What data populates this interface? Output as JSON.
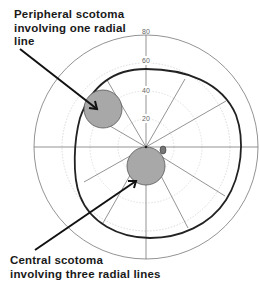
{
  "diagram": {
    "type": "visual-field-perimetry",
    "ring_labels": [
      "20",
      "40",
      "60",
      "80"
    ],
    "radial_lines_count": 12,
    "annotations": [
      {
        "id": "peripheral",
        "lines": [
          "Peripheral scotoma",
          "involving one radial",
          "line"
        ]
      },
      {
        "id": "central",
        "lines": [
          "Central scotoma",
          "involving three radial lines"
        ]
      }
    ],
    "elements": [
      "isopter",
      "peripheral scotoma",
      "central scotoma",
      "blind spot"
    ]
  },
  "colors": {
    "scotoma_fill": "#a8a8a8",
    "isopter": "#222222",
    "grid": "#888888"
  }
}
